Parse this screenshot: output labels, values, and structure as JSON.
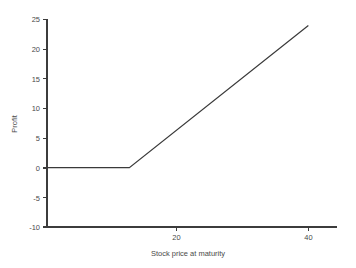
{
  "chart_data": {
    "type": "line",
    "title": "",
    "xlabel": "Stock price at maturity",
    "ylabel": "Profit",
    "xlim": [
      8.5,
      49.0
    ],
    "ylim": [
      -10,
      25
    ],
    "grid": false,
    "legend": null,
    "x_ticks": [
      20,
      40
    ],
    "x_tick_labels": [
      "20",
      "40"
    ],
    "y_ticks": [
      -10,
      -5,
      0,
      5,
      10,
      15,
      20,
      25
    ],
    "y_tick_labels": [
      "-10",
      "-5",
      "0",
      "5",
      "10",
      "15",
      "20",
      "25"
    ],
    "series": [
      {
        "name": "Long call profit",
        "x": [
          8.5,
          20,
          45
        ],
        "values": [
          0,
          0,
          24
        ],
        "color": "#3a3a3a"
      }
    ],
    "annotations": []
  },
  "axes": {
    "y_label_text": "Profit",
    "x_label_text": "Stock price at maturity",
    "y_tick_0": "-10",
    "y_tick_1": "-5",
    "y_tick_2": "0",
    "y_tick_3": "5",
    "y_tick_4": "10",
    "y_tick_5": "15",
    "y_tick_6": "20",
    "y_tick_7": "25",
    "x_tick_0": "20",
    "x_tick_1": "40"
  },
  "colors": {
    "background": "#ffffff",
    "axis": "#3c3c3c",
    "series": "#3a3a3a",
    "text": "#4a4a4a"
  }
}
